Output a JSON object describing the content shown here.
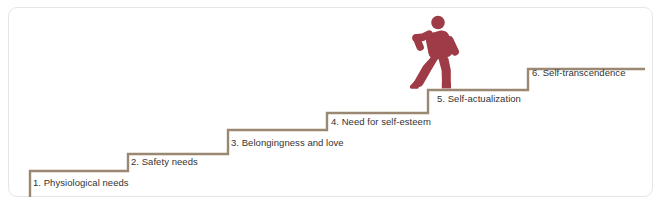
{
  "diagram": {
    "type": "staircase",
    "step_line_color": "#9a8872",
    "figure_color": "#9e3b46",
    "label_color": "#333333",
    "card_background": "#ffffff",
    "card_border_color": "#e6e6e6",
    "steps": [
      {
        "number": "1",
        "label": "1. Physiological needs"
      },
      {
        "number": "2",
        "label": "2. Safety needs"
      },
      {
        "number": "3",
        "label": "3. Belongingness and love"
      },
      {
        "number": "4",
        "label": "4. Need for self-esteem"
      },
      {
        "number": "5",
        "label": "5. Self-actualization"
      },
      {
        "number": "6",
        "label": "6. Self-transcendence"
      }
    ],
    "figure": {
      "name": "walking-person",
      "on_step": "5",
      "description": "person climbing stairs"
    }
  }
}
